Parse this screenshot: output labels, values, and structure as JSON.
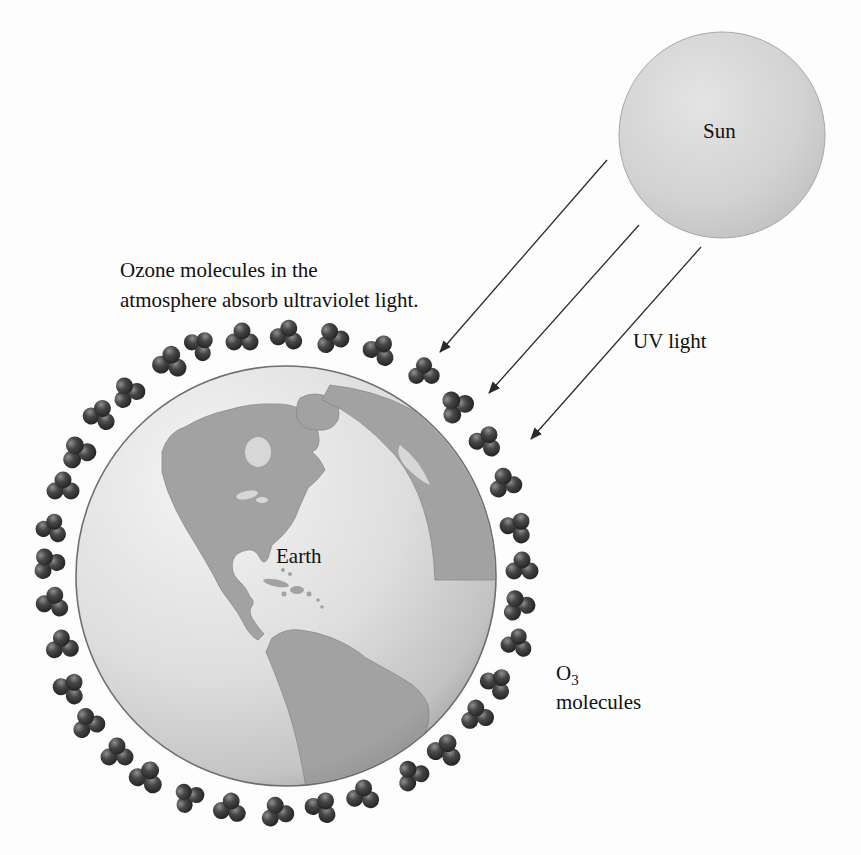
{
  "figure": {
    "caption": {
      "line1": "Ozone molecules in the",
      "line2": "atmosphere absorb ultraviolet light."
    }
  },
  "labels": {
    "sun": "Sun",
    "uv_light": "UV light",
    "earth": "Earth",
    "o3_symbol": "O",
    "o3_subscript": "3",
    "o3_word": "molecules"
  },
  "colors": {
    "background": "#fdfdfd",
    "caption_bg": "#e2e2e2",
    "text": "#111111",
    "sun_light": "#e4e4e4",
    "sun_dark": "#bfbfbf",
    "sun_rim": "#a8a8a8",
    "ocean_light": "#f4f4f4",
    "ocean_mid": "#dedede",
    "ocean_dark": "#b6b6b6",
    "globe_rim": "#6f6f6f",
    "land": "#a2a2a2",
    "land_edge": "#8a8a8a",
    "land_light_patch": "#d7d7d7",
    "arrow": "#2a2a2a",
    "molecule_highlight": "#8f8f8f",
    "molecule_mid": "#474747",
    "molecule_dark": "#1e1e1e"
  },
  "diagram": {
    "sun": {
      "cx": 722,
      "cy": 135,
      "r": 103
    },
    "globe": {
      "cx": 286,
      "cy": 576,
      "r": 210
    },
    "arrows": [
      {
        "x1": 607,
        "y1": 160,
        "x2": 440,
        "y2": 352
      },
      {
        "x1": 639,
        "y1": 225,
        "x2": 489,
        "y2": 393
      },
      {
        "x1": 701,
        "y1": 247,
        "x2": 531,
        "y2": 439
      }
    ],
    "molecule_shape": {
      "atoms": [
        {
          "dx": -8,
          "dy": 4,
          "r": 8.5
        },
        {
          "dx": 8,
          "dy": 4,
          "r": 8.5
        },
        {
          "dx": 0,
          "dy": -7,
          "r": 8.5
        }
      ]
    },
    "molecules": [
      {
        "x": 100,
        "y": 415,
        "rot": 20,
        "s": 1.0
      },
      {
        "x": 128,
        "y": 392,
        "rot": -30,
        "s": 1.0
      },
      {
        "x": 170,
        "y": 362,
        "rot": 10,
        "s": 1.05
      },
      {
        "x": 200,
        "y": 345,
        "rot": 45,
        "s": 0.95
      },
      {
        "x": 242,
        "y": 338,
        "rot": 0,
        "s": 1.0
      },
      {
        "x": 287,
        "y": 335,
        "rot": 15,
        "s": 1.0
      },
      {
        "x": 332,
        "y": 338,
        "rot": -20,
        "s": 1.0
      },
      {
        "x": 380,
        "y": 350,
        "rot": 30,
        "s": 1.0
      },
      {
        "x": 424,
        "y": 372,
        "rot": 0,
        "s": 0.95
      },
      {
        "x": 456,
        "y": 406,
        "rot": -40,
        "s": 1.05
      },
      {
        "x": 486,
        "y": 441,
        "rot": 25,
        "s": 1.0
      },
      {
        "x": 505,
        "y": 483,
        "rot": -15,
        "s": 1.0
      },
      {
        "x": 517,
        "y": 527,
        "rot": 35,
        "s": 1.0
      },
      {
        "x": 522,
        "y": 567,
        "rot": 0,
        "s": 1.0
      },
      {
        "x": 518,
        "y": 605,
        "rot": -25,
        "s": 1.0
      },
      {
        "x": 517,
        "y": 643,
        "rot": 15,
        "s": 0.95
      },
      {
        "x": 497,
        "y": 683,
        "rot": 40,
        "s": 1.0
      },
      {
        "x": 477,
        "y": 715,
        "rot": -10,
        "s": 1.0
      },
      {
        "x": 445,
        "y": 750,
        "rot": 20,
        "s": 1.05
      },
      {
        "x": 412,
        "y": 775,
        "rot": -35,
        "s": 1.0
      },
      {
        "x": 363,
        "y": 795,
        "rot": 5,
        "s": 1.0
      },
      {
        "x": 322,
        "y": 807,
        "rot": 30,
        "s": 1.0
      },
      {
        "x": 277,
        "y": 812,
        "rot": -15,
        "s": 1.0
      },
      {
        "x": 230,
        "y": 808,
        "rot": 10,
        "s": 1.0
      },
      {
        "x": 188,
        "y": 797,
        "rot": -40,
        "s": 0.95
      },
      {
        "x": 147,
        "y": 777,
        "rot": 25,
        "s": 1.05
      },
      {
        "x": 117,
        "y": 753,
        "rot": 0,
        "s": 1.0
      },
      {
        "x": 88,
        "y": 723,
        "rot": -20,
        "s": 1.0
      },
      {
        "x": 70,
        "y": 688,
        "rot": 35,
        "s": 1.0
      },
      {
        "x": 62,
        "y": 645,
        "rot": -5,
        "s": 1.0
      },
      {
        "x": 53,
        "y": 602,
        "rot": 15,
        "s": 1.0
      },
      {
        "x": 48,
        "y": 563,
        "rot": -30,
        "s": 1.0
      },
      {
        "x": 52,
        "y": 528,
        "rot": 20,
        "s": 0.95
      },
      {
        "x": 63,
        "y": 487,
        "rot": 0,
        "s": 1.0
      },
      {
        "x": 78,
        "y": 452,
        "rot": -25,
        "s": 1.05
      }
    ]
  }
}
